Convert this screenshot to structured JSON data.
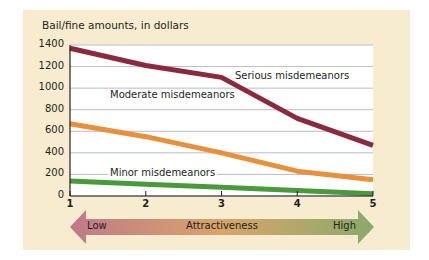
{
  "chart_data": {
    "type": "line",
    "title": "",
    "ylabel": "Bail/fine amounts, in dollars",
    "xlabel": "Attractiveness",
    "x": [
      1,
      2,
      3,
      4,
      5
    ],
    "xticks": [
      "1",
      "2",
      "3",
      "4",
      "5"
    ],
    "yticks": [
      "0",
      "200",
      "400",
      "600",
      "800",
      "1000",
      "1200",
      "1400"
    ],
    "ylim": [
      0,
      1400
    ],
    "xlim": [
      1,
      5
    ],
    "grid": true,
    "series": [
      {
        "name": "Serious misdemeanors",
        "color": "#8b2a3c",
        "values": [
          1370,
          1210,
          1100,
          720,
          470
        ]
      },
      {
        "name": "Moderate misdemeanors",
        "color": "#e8913a",
        "values": [
          670,
          550,
          400,
          230,
          150
        ]
      },
      {
        "name": "Minor misdemeanors",
        "color": "#4a9a3c",
        "values": [
          140,
          110,
          80,
          50,
          20
        ]
      }
    ],
    "axis_arrow": {
      "left_label": "Low",
      "center_label": "Attractiveness",
      "right_label": "High"
    }
  },
  "colors": {
    "panel_bg": "#f8ecd0",
    "plot_bg": "#ffffff",
    "grid": "#b8bccf",
    "arrow_left": "#c0788a",
    "arrow_mid": "#d9a56a",
    "arrow_right": "#8aaa6a"
  }
}
